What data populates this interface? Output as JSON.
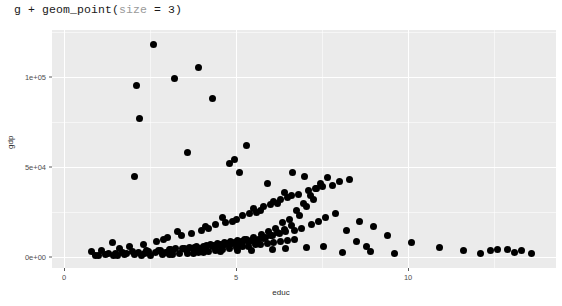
{
  "console": {
    "code_prefix": "g + geom_point(",
    "code_arg": "size",
    "code_suffix": " = 3)"
  },
  "colors": {
    "panel_background": "#EBEBEB",
    "gridline": "#FFFFFF",
    "point": "#000000",
    "page_background": "#FFFFFF",
    "axis_text": "#4D4D4D",
    "code_argument": "#9A9A9A"
  },
  "chart_data": {
    "type": "scatter",
    "title": "",
    "xlabel": "educ",
    "ylabel": "gdp",
    "xlim": [
      -0.35,
      14.3
    ],
    "ylim": [
      -6000,
      126000
    ],
    "grid": true,
    "legend": "none",
    "point_size": 3,
    "xticks": [
      {
        "value": 0,
        "label": "0"
      },
      {
        "value": 5,
        "label": "5"
      },
      {
        "value": 10,
        "label": "10"
      }
    ],
    "xticks_minor": [
      2.5,
      7.5,
      12.5
    ],
    "yticks": [
      {
        "value": 0,
        "label": "0e+00"
      },
      {
        "value": 50000,
        "label": "5e+04"
      },
      {
        "value": 100000,
        "label": "1e+05"
      }
    ],
    "yticks_minor": [
      25000,
      75000,
      125000
    ],
    "n_points": 193,
    "x": [
      2.6,
      3.2,
      2.1,
      3.9,
      4.3,
      2.2,
      5.3,
      3.6,
      4.8,
      5.1,
      1.4,
      2.9,
      3.3,
      4.1,
      4.6,
      5.5,
      6.1,
      6.4,
      5.9,
      7.0,
      0.8,
      1.1,
      1.6,
      1.9,
      2.3,
      2.7,
      3.0,
      3.4,
      3.7,
      4.0,
      4.2,
      4.4,
      4.7,
      4.9,
      5.0,
      5.2,
      5.4,
      5.6,
      5.7,
      5.8,
      6.0,
      6.2,
      6.3,
      6.5,
      6.6,
      6.8,
      7.1,
      7.3,
      7.5,
      7.8,
      8.0,
      8.3,
      8.6,
      9.0,
      9.4,
      10.1,
      11.6,
      12.4,
      12.9,
      13.3,
      1.3,
      1.7,
      2.0,
      2.4,
      2.8,
      3.1,
      3.5,
      3.8,
      4.05,
      4.35,
      4.55,
      4.75,
      4.95,
      5.15,
      5.35,
      5.45,
      5.65,
      5.85,
      6.05,
      6.25,
      6.45,
      6.7,
      6.9,
      7.2,
      7.4,
      7.6,
      7.9,
      8.2,
      8.5,
      8.8,
      0.9,
      1.2,
      1.5,
      1.8,
      2.15,
      2.45,
      2.75,
      3.05,
      3.25,
      3.45,
      3.65,
      3.85,
      4.15,
      4.25,
      4.45,
      4.65,
      4.85,
      5.05,
      5.25,
      5.3,
      5.5,
      5.75,
      5.95,
      6.15,
      6.35,
      6.55,
      6.75,
      6.95,
      7.15,
      7.35,
      1.0,
      1.45,
      1.75,
      2.05,
      2.35,
      2.65,
      2.95,
      3.15,
      3.55,
      3.75,
      3.95,
      4.1,
      4.3,
      4.5,
      4.7,
      4.9,
      5.1,
      5.2,
      5.4,
      5.6,
      5.8,
      6.0,
      6.2,
      6.4,
      6.6,
      6.85,
      7.05,
      7.25,
      7.45,
      7.65,
      2.5,
      2.85,
      3.15,
      3.35,
      3.6,
      3.9,
      4.2,
      4.4,
      4.6,
      4.8,
      5.0,
      5.2,
      5.35,
      5.55,
      5.7,
      5.9,
      6.1,
      6.3,
      6.5,
      6.7,
      1.55,
      2.25,
      3.05,
      3.75,
      4.05,
      4.55,
      5.05,
      5.45,
      6.05,
      6.45,
      7.05,
      7.55,
      8.1,
      8.9,
      9.6,
      10.9,
      12.1,
      12.6,
      13.1,
      13.6,
      2.05,
      4.95,
      6.65
    ],
    "y": [
      118000,
      99000,
      95000,
      105000,
      88000,
      77000,
      62000,
      58000,
      52000,
      47000,
      8000,
      10000,
      14000,
      17000,
      22000,
      27000,
      31000,
      36000,
      41000,
      45000,
      3000,
      4000,
      5000,
      6000,
      7000,
      9000,
      11000,
      12000,
      13000,
      15000,
      16000,
      18000,
      19000,
      20000,
      21000,
      23000,
      24000,
      25000,
      26000,
      28000,
      29000,
      30000,
      32000,
      33000,
      34000,
      35000,
      37000,
      38000,
      39000,
      40000,
      42000,
      43000,
      20000,
      17000,
      12000,
      8000,
      4000,
      3500,
      4200,
      3800,
      2000,
      2500,
      3000,
      3500,
      4000,
      4500,
      5000,
      5500,
      6000,
      6500,
      7000,
      7500,
      8000,
      8500,
      9000,
      9500,
      10000,
      11000,
      12000,
      13000,
      14000,
      15000,
      16000,
      18000,
      20000,
      22000,
      24000,
      15000,
      9000,
      6000,
      1200,
      1500,
      1800,
      2200,
      2600,
      3100,
      3600,
      4100,
      4600,
      5100,
      5600,
      6100,
      6600,
      7100,
      7600,
      8100,
      8600,
      9100,
      9600,
      10100,
      11000,
      12500,
      14000,
      16000,
      19000,
      21000,
      26000,
      30000,
      34000,
      38000,
      900,
      1100,
      1400,
      1700,
      2100,
      2400,
      2900,
      3300,
      3900,
      4400,
      4900,
      5400,
      5900,
      6400,
      6900,
      7400,
      7900,
      8400,
      8900,
      9400,
      10500,
      12000,
      13500,
      15500,
      17500,
      23000,
      28000,
      32000,
      41000,
      44000,
      1000,
      1300,
      1600,
      2000,
      2300,
      2700,
      3200,
      3700,
      4200,
      4700,
      5200,
      5700,
      6200,
      6800,
      7300,
      7800,
      8300,
      8800,
      9300,
      9800,
      700,
      1000,
      1500,
      2000,
      2500,
      3000,
      3500,
      4000,
      4500,
      5000,
      5500,
      6000,
      2500,
      3000,
      2000,
      5500,
      2000,
      4500,
      2500,
      2000,
      45000,
      54000,
      47000
    ]
  }
}
